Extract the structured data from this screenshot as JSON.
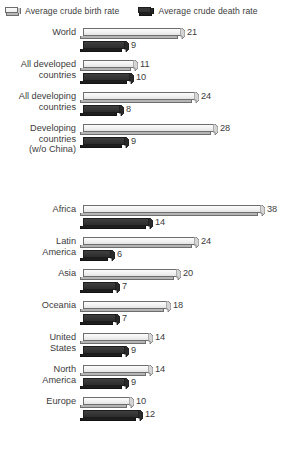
{
  "legend": {
    "items": [
      {
        "label": "Average crude birth rate",
        "swatch": "light-3d-box-icon",
        "color": "#ededed"
      },
      {
        "label": "Average crude death rate",
        "swatch": "dark-3d-box-icon",
        "color": "#353535"
      }
    ]
  },
  "caption": {
    "text": ""
  },
  "chart_data": {
    "type": "bar",
    "title": "",
    "subtitle": "",
    "xlabel": "",
    "ylabel": "",
    "orientation": "horizontal",
    "grid": false,
    "legend_position": "top",
    "xlim": [
      0,
      38
    ],
    "px_per_unit": 4.68,
    "series": [
      {
        "name": "Average crude birth rate",
        "color": "#ededed"
      },
      {
        "name": "Average crude death rate",
        "color": "#353535"
      }
    ],
    "groups": [
      {
        "name": "aggregates",
        "categories": [
          "World",
          "All developed\ncountries",
          "All developing\ncountries",
          "Developing\ncountries\n(w/o China)"
        ],
        "birth": [
          21,
          11,
          24,
          28
        ],
        "death": [
          9,
          10,
          8,
          9
        ]
      },
      {
        "name": "regions",
        "categories": [
          "Africa",
          "Latin\nAmerica",
          "Asia",
          "Oceania",
          "United\nStates",
          "North\nAmerica",
          "Europe"
        ],
        "birth": [
          38,
          24,
          20,
          18,
          14,
          14,
          10
        ],
        "death": [
          14,
          6,
          7,
          7,
          9,
          9,
          12
        ]
      }
    ]
  }
}
